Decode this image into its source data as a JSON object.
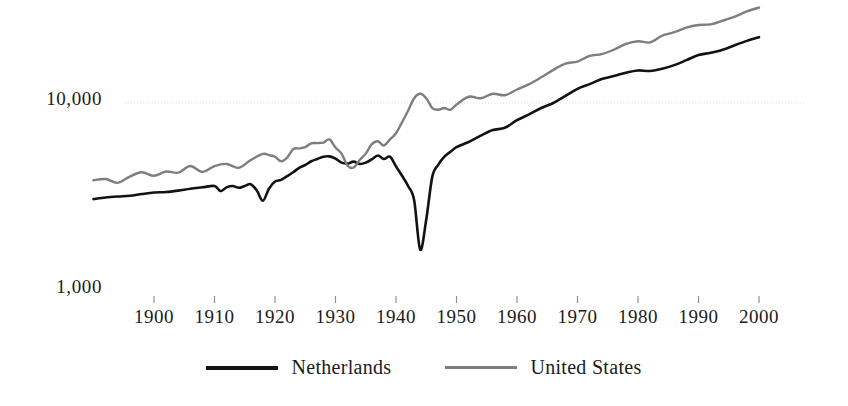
{
  "chart_data": {
    "type": "line",
    "title": "",
    "subtitle": "",
    "xlabel": "",
    "ylabel": "",
    "yscale": "log",
    "ylim": [
      1000,
      40000
    ],
    "xlim": [
      1890,
      2001
    ],
    "grid": "horizontal gridline at 10,000 only",
    "legend_position": "bottom-center",
    "y_tick_labels": [
      "10,000",
      "1,000"
    ],
    "y_tick_values": [
      10000,
      1000
    ],
    "x_tick_labels": [
      "1900",
      "1910",
      "1920",
      "1930",
      "1940",
      "1950",
      "1960",
      "1970",
      "1980",
      "1990",
      "2000"
    ],
    "x_tick_values": [
      1900,
      1910,
      1920,
      1930,
      1940,
      1950,
      1960,
      1970,
      1980,
      1990,
      2000
    ],
    "series": [
      {
        "name": "Netherlands",
        "color": "#121212",
        "width": 2.6,
        "x": [
          1890,
          1892,
          1894,
          1896,
          1898,
          1900,
          1902,
          1904,
          1906,
          1908,
          1910,
          1911,
          1912,
          1913,
          1914,
          1915,
          1916,
          1917,
          1918,
          1919,
          1920,
          1921,
          1922,
          1923,
          1924,
          1925,
          1926,
          1927,
          1928,
          1929,
          1930,
          1931,
          1932,
          1933,
          1934,
          1935,
          1936,
          1937,
          1938,
          1939,
          1940,
          1941,
          1942,
          1943,
          1944,
          1945,
          1946,
          1947,
          1948,
          1949,
          1950,
          1952,
          1954,
          1956,
          1958,
          1960,
          1962,
          1964,
          1966,
          1968,
          1970,
          1972,
          1974,
          1976,
          1978,
          1980,
          1982,
          1984,
          1986,
          1988,
          1990,
          1992,
          1994,
          1996,
          1998,
          2000
        ],
        "y": [
          3080,
          3140,
          3180,
          3210,
          3280,
          3340,
          3360,
          3420,
          3500,
          3560,
          3620,
          3400,
          3560,
          3620,
          3540,
          3620,
          3700,
          3420,
          3020,
          3500,
          3820,
          3900,
          4080,
          4280,
          4520,
          4680,
          4900,
          5040,
          5180,
          5200,
          5060,
          4820,
          4760,
          4880,
          4740,
          4820,
          5020,
          5260,
          5040,
          5180,
          4600,
          4100,
          3620,
          3040,
          1660,
          2400,
          4060,
          4700,
          5180,
          5500,
          5820,
          6200,
          6700,
          7180,
          7380,
          8100,
          8700,
          9400,
          10000,
          10900,
          11900,
          12600,
          13400,
          13900,
          14500,
          14900,
          14800,
          15200,
          15900,
          16900,
          18000,
          18500,
          19200,
          20300,
          21400,
          22400
        ]
      },
      {
        "name": "United States",
        "color": "#7e7e7e",
        "width": 2.4,
        "x": [
          1890,
          1892,
          1894,
          1896,
          1898,
          1900,
          1902,
          1904,
          1906,
          1908,
          1910,
          1912,
          1914,
          1916,
          1918,
          1919,
          1920,
          1921,
          1922,
          1923,
          1924,
          1925,
          1926,
          1927,
          1928,
          1929,
          1930,
          1931,
          1932,
          1933,
          1934,
          1935,
          1936,
          1937,
          1938,
          1939,
          1940,
          1941,
          1942,
          1943,
          1944,
          1945,
          1946,
          1947,
          1948,
          1949,
          1950,
          1952,
          1954,
          1956,
          1958,
          1960,
          1962,
          1964,
          1966,
          1968,
          1970,
          1972,
          1974,
          1976,
          1978,
          1980,
          1982,
          1984,
          1986,
          1988,
          1990,
          1992,
          1994,
          1996,
          1998,
          2000
        ],
        "y": [
          3880,
          3940,
          3760,
          4060,
          4280,
          4100,
          4320,
          4260,
          4620,
          4300,
          4620,
          4740,
          4520,
          4980,
          5360,
          5280,
          5180,
          4900,
          5120,
          5680,
          5740,
          5820,
          6100,
          6120,
          6160,
          6400,
          5800,
          5380,
          4640,
          4540,
          4980,
          5380,
          6040,
          6260,
          5940,
          6400,
          6900,
          7900,
          9100,
          10600,
          11200,
          10600,
          9400,
          9200,
          9400,
          9200,
          9800,
          10800,
          10600,
          11200,
          11000,
          11800,
          12600,
          13700,
          15000,
          16200,
          16600,
          17800,
          18200,
          19200,
          20600,
          21300,
          21000,
          22800,
          23800,
          25200,
          26000,
          26200,
          27400,
          28800,
          30700,
          32200
        ]
      }
    ],
    "annotations": [
      {
        "text": "Netherlands WWI dip",
        "year": 1918
      },
      {
        "text": "Netherlands WWII collapse",
        "year": 1944
      },
      {
        "text": "United States WWII boom peak",
        "year": 1944
      }
    ]
  },
  "axes": {
    "y_ticks": [
      {
        "label": "10,000",
        "value": 10000
      },
      {
        "label": "1,000",
        "value": 1000
      }
    ],
    "x_ticks": [
      {
        "label": "1900",
        "value": 1900
      },
      {
        "label": "1910",
        "value": 1910
      },
      {
        "label": "1920",
        "value": 1920
      },
      {
        "label": "1930",
        "value": 1930
      },
      {
        "label": "1940",
        "value": 1940
      },
      {
        "label": "1950",
        "value": 1950
      },
      {
        "label": "1960",
        "value": 1960
      },
      {
        "label": "1970",
        "value": 1970
      },
      {
        "label": "1980",
        "value": 1980
      },
      {
        "label": "1990",
        "value": 1990
      },
      {
        "label": "2000",
        "value": 2000
      }
    ]
  },
  "legend": {
    "items": [
      {
        "label": "Netherlands",
        "color": "#121212"
      },
      {
        "label": "United States",
        "color": "#7e7e7e"
      }
    ]
  },
  "style": {
    "background": "#ffffff",
    "gridline_color": "#dedede",
    "text_color": "#1b1b1b"
  }
}
